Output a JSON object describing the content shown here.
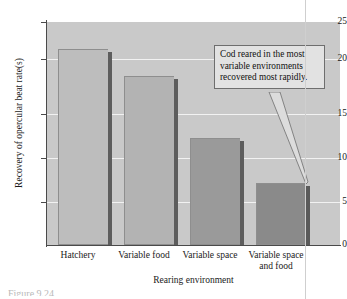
{
  "chart_data": {
    "type": "bar",
    "title": "",
    "xlabel": "Rearing environment",
    "ylabel": "Recovery of opercular beat rate(s)",
    "categories": [
      "Hatchery",
      "Variable food",
      "Variable space",
      "Variable space and food"
    ],
    "values": [
      22,
      19,
      12,
      7
    ],
    "ylim": [
      0,
      25
    ],
    "yticks": [
      0,
      5,
      10,
      15,
      20,
      25
    ],
    "ytick_labels": [
      "0",
      "5",
      "10",
      "15",
      "20",
      "25"
    ],
    "grid": true,
    "legend": false,
    "bar_colors": [
      "#bdbdbd",
      "#b3b3b3",
      "#9a9a9a",
      "#8a8a8a"
    ],
    "bar_side_colors": [
      "#5d5d5d",
      "#5d5d5d",
      "#5d5d5d",
      "#5a5a5a"
    ],
    "plot_background": "#c9c9c9",
    "gridline_color": "#f2f2f2",
    "axis_color": "#4a4a4a",
    "annotations": [
      {
        "text": "Cod reared in the most variable environments recovered most rapidly.",
        "points_to_category": "Variable space and food"
      }
    ]
  },
  "axis": {
    "y_ticks": [
      {
        "label": "25",
        "value": 25
      },
      {
        "label": "20",
        "value": 20
      },
      {
        "label": "15",
        "value": 15
      },
      {
        "label": "10",
        "value": 10
      },
      {
        "label": "5",
        "value": 5
      },
      {
        "label": "0",
        "value": 0
      }
    ],
    "y_title": "Recovery of opercular beat rate(s)",
    "x_title": "Rearing environment",
    "x_categories": [
      {
        "line1": "Hatchery",
        "line2": ""
      },
      {
        "line1": "Variable food",
        "line2": ""
      },
      {
        "line1": "Variable space",
        "line2": ""
      },
      {
        "line1": "Variable space",
        "line2": "and food"
      }
    ]
  },
  "callout": {
    "text": "Cod reared in the most variable environments recovered most rapidly."
  },
  "caption": {
    "clipped_text": "Figure 9.24"
  }
}
